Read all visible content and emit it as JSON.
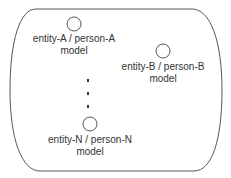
{
  "diagram": {
    "container": {
      "shape": "rounded-barrel",
      "stroke": "#555555"
    },
    "nodes": [
      {
        "id": "A",
        "label_line1": "entity-A / person-A",
        "label_line2": "model"
      },
      {
        "id": "B",
        "label_line1": "entity-B / person-B",
        "label_line2": "model"
      },
      {
        "id": "N",
        "label_line1": "entity-N / person-N",
        "label_line2": "model"
      }
    ],
    "ellipsis": "vertical-dots",
    "colors": {
      "stroke": "#555555",
      "text": "#333333",
      "dot": "#333333",
      "background": "#ffffff"
    }
  }
}
